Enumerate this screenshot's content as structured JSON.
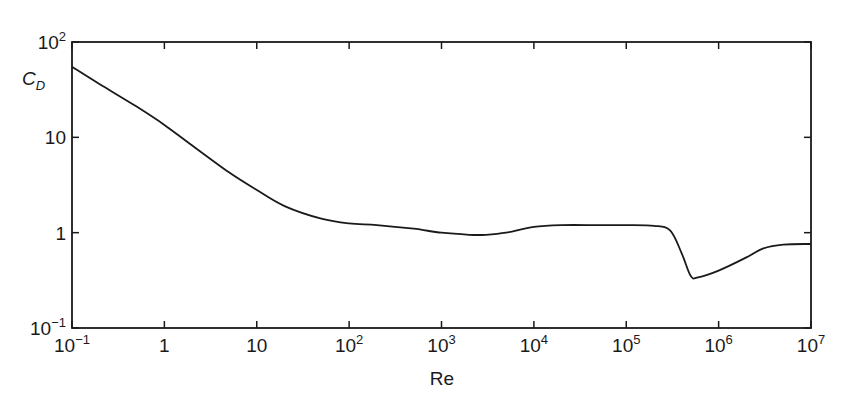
{
  "chart_data": {
    "type": "line",
    "title": "",
    "xlabel": "Re",
    "ylabel": "C_D",
    "ylabel_main": "C",
    "ylabel_sub": "D",
    "x_scale": "log",
    "y_scale": "log",
    "xlim": [
      0.1,
      10000000
    ],
    "ylim": [
      0.1,
      100
    ],
    "grid": false,
    "legend": null,
    "x_ticks": [
      {
        "value": 0.1,
        "base": "10",
        "exp": "−1"
      },
      {
        "value": 1,
        "base": "1",
        "exp": ""
      },
      {
        "value": 10,
        "base": "10",
        "exp": ""
      },
      {
        "value": 100,
        "base": "10",
        "exp": "2"
      },
      {
        "value": 1000,
        "base": "10",
        "exp": "3"
      },
      {
        "value": 10000,
        "base": "10",
        "exp": "4"
      },
      {
        "value": 100000,
        "base": "10",
        "exp": "5"
      },
      {
        "value": 1000000,
        "base": "10",
        "exp": "6"
      },
      {
        "value": 10000000,
        "base": "10",
        "exp": "7"
      }
    ],
    "y_ticks": [
      {
        "value": 0.1,
        "base": "10",
        "exp": "−1"
      },
      {
        "value": 1,
        "base": "1",
        "exp": ""
      },
      {
        "value": 10,
        "base": "10",
        "exp": ""
      },
      {
        "value": 100,
        "base": "10",
        "exp": "2"
      }
    ],
    "series": [
      {
        "name": "Drag coefficient of sphere",
        "x": [
          0.1,
          0.2,
          0.5,
          1,
          2,
          5,
          10,
          20,
          50,
          100,
          200,
          500,
          1000,
          2000,
          3000,
          5000,
          10000,
          20000,
          50000,
          100000,
          200000,
          300000,
          400000,
          500000,
          600000,
          1000000,
          2000000,
          3000000,
          5000000,
          10000000
        ],
        "values": [
          55,
          36,
          21,
          13.5,
          8.2,
          4.3,
          2.8,
          1.9,
          1.4,
          1.25,
          1.2,
          1.1,
          1.0,
          0.95,
          0.95,
          1.0,
          1.15,
          1.2,
          1.2,
          1.2,
          1.18,
          1.05,
          0.6,
          0.35,
          0.34,
          0.4,
          0.55,
          0.68,
          0.75,
          0.76
        ]
      }
    ]
  }
}
